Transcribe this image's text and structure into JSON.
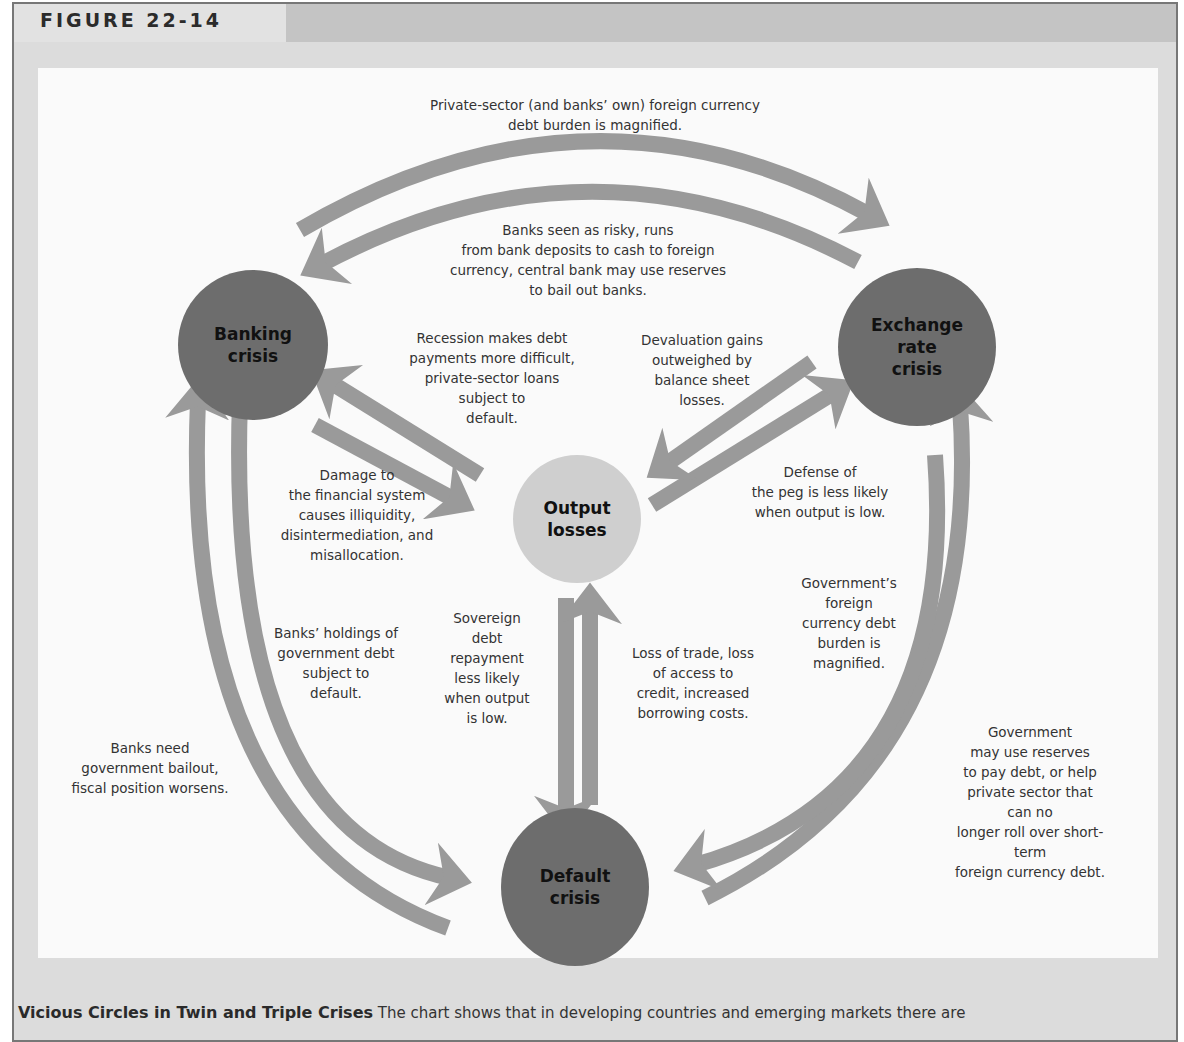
{
  "figure": {
    "label": "FIGURE 22-14",
    "caption_title": "Vicious Circles in Twin and Triple Crises",
    "caption_text": "The chart shows that in developing countries and emerging markets there are"
  },
  "colors": {
    "arrow": "#999999",
    "node_dark": "#6d6d6d",
    "node_light": "#cfcfcf",
    "panel_bg": "#fafafa",
    "frame_bg": "#dcdcdc"
  },
  "nodes": {
    "banking": {
      "line1": "Banking",
      "line2": "crisis"
    },
    "exchange": {
      "line1": "Exchange",
      "line2": "rate",
      "line3": "crisis"
    },
    "output": {
      "line1": "Output",
      "line2": "losses"
    },
    "default": {
      "line1": "Default",
      "line2": "crisis"
    }
  },
  "labels": {
    "top_outer": [
      "Private-sector (and banks’ own) foreign currency",
      "debt burden is magnified."
    ],
    "top_inner": [
      "Banks seen as risky, runs",
      "from bank deposits to cash to foreign",
      "currency, central bank may use reserves",
      "to bail out banks."
    ],
    "recession": [
      "Recession makes debt",
      "payments more difficult,",
      "private-sector loans",
      "subject to",
      "default."
    ],
    "devaluation": [
      "Devaluation gains",
      "outweighed by",
      "balance sheet",
      "losses."
    ],
    "damage": [
      "Damage to",
      "the financial system",
      "causes illiquidity,",
      "disintermediation, and",
      "misallocation."
    ],
    "defense": [
      "Defense of",
      "the peg is less likely",
      "when output is low."
    ],
    "gov_foreign": [
      "Government’s",
      "foreign",
      "currency debt",
      "burden is",
      "magnified."
    ],
    "banks_holdings": [
      "Banks’ holdings of",
      "government debt",
      "subject to",
      "default."
    ],
    "sovereign": [
      "Sovereign",
      "debt",
      "repayment",
      "less likely",
      "when output",
      "is low."
    ],
    "loss_trade": [
      "Loss of trade, loss",
      "of access to",
      "credit, increased",
      "borrowing costs."
    ],
    "banks_need": [
      "Banks need",
      "government bailout,",
      "fiscal position worsens."
    ],
    "gov_reserves": [
      "Government",
      "may use reserves",
      "to pay debt, or help",
      "private sector that can no",
      "longer roll over short-term",
      "foreign currency debt."
    ]
  }
}
